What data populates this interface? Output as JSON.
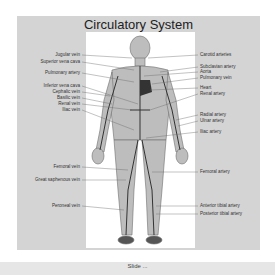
{
  "title": "Circulatory System",
  "labels_left": [
    {
      "text": "Jugular vein",
      "y": 0
    },
    {
      "text": "Superior vena cava",
      "y": 1
    },
    {
      "text": "Pulmonary artery",
      "y": 2
    },
    {
      "text": "Inferior vena cava",
      "y": 3
    },
    {
      "text": "Cephalic vein",
      "y": 4
    },
    {
      "text": "Basilic vein",
      "y": 5
    },
    {
      "text": "Renal vein",
      "y": 6
    },
    {
      "text": "Iliac vein",
      "y": 7
    },
    {
      "text": "Femoral vein",
      "y": 8
    },
    {
      "text": "Great saphenous vein",
      "y": 9
    },
    {
      "text": "Peroneal vein",
      "y": 10
    }
  ],
  "labels_right": [
    {
      "text": "Carotid arteries"
    },
    {
      "text": "Subclavian artery"
    },
    {
      "text": "Aorta"
    },
    {
      "text": "Pulmonary vein"
    },
    {
      "text": "Heart"
    },
    {
      "text": "Renal artery"
    },
    {
      "text": "Radial artery"
    },
    {
      "text": "Ulnar artery"
    },
    {
      "text": "Iliac artery"
    },
    {
      "text": "Femoral artery"
    },
    {
      "text": "Anterior tibial artery"
    },
    {
      "text": "Posterior tibial artery"
    }
  ],
  "footer": {
    "caption": "Slide ..."
  }
}
